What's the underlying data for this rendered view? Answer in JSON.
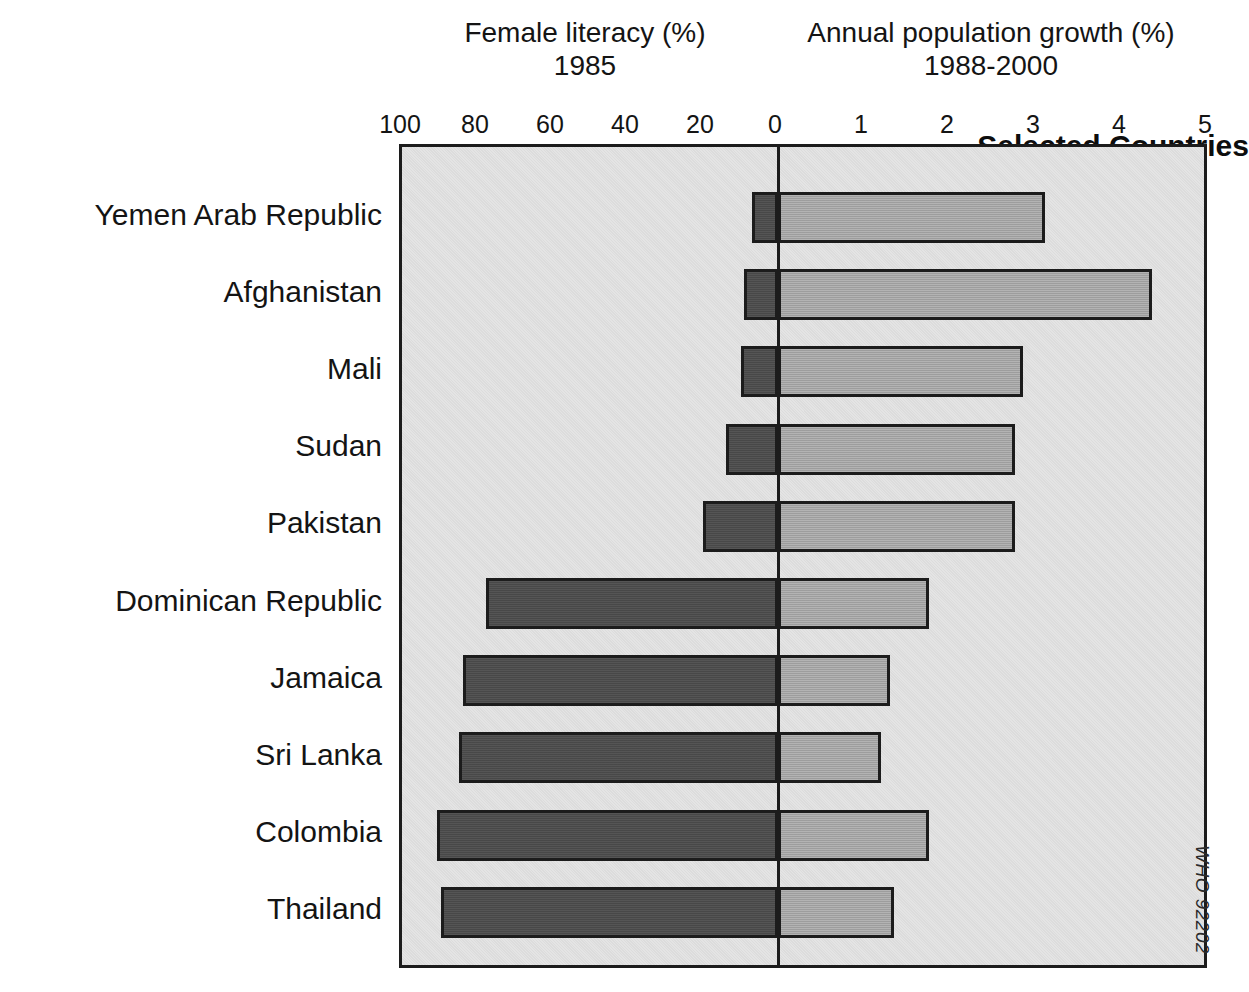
{
  "headings": {
    "left_title_line1": "Female literacy (%)",
    "left_title_line2": "1985",
    "right_title_line1": "Annual population growth (%)",
    "right_title_line2": "1988-2000",
    "group_heading": "Selected Countries"
  },
  "credit": "WHO 92202",
  "colors": {
    "literacy_bar": "#4c4c4c",
    "growth_bar": "#a9a9a9",
    "plot_background": "#e4e4e4",
    "outline": "#1c1c1c",
    "text": "#141414"
  },
  "chart_data": {
    "type": "bar",
    "orientation": "horizontal",
    "layout": "diverging-butterfly",
    "categories": [
      "Yemen Arab Republic",
      "Afghanistan",
      "Mali",
      "Sudan",
      "Pakistan",
      "Dominican Republic",
      "Jamaica",
      "Sri Lanka",
      "Colombia",
      "Thailand"
    ],
    "series": [
      {
        "name": "Female literacy (%) 1985",
        "side": "left",
        "axis_label": "Female literacy (%)",
        "axis_sublabel": "1985",
        "ticks": [
          100,
          80,
          60,
          40,
          20,
          0
        ],
        "axis_min": 0,
        "axis_max": 100,
        "color": "#4c4c4c",
        "values": [
          7,
          9,
          10,
          14,
          20,
          78,
          84,
          85,
          91,
          90
        ]
      },
      {
        "name": "Annual population growth (%) 1988-2000",
        "side": "right",
        "axis_label": "Annual population growth (%)",
        "axis_sublabel": "1988-2000",
        "ticks": [
          0,
          1,
          2,
          3,
          4,
          5
        ],
        "axis_min": 0,
        "axis_max": 5,
        "color": "#a9a9a9",
        "values": [
          3.1,
          4.35,
          2.85,
          2.75,
          2.75,
          1.75,
          1.3,
          1.2,
          1.75,
          1.35
        ]
      }
    ],
    "grid": false,
    "legend": "none",
    "annotations": [
      "Selected Countries",
      "WHO 92202"
    ]
  }
}
